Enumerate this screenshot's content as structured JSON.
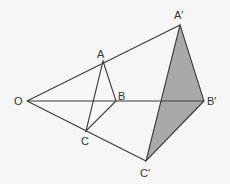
{
  "diagram": {
    "type": "enlargement-geometry",
    "colors": {
      "background": "#f6f6f6",
      "line": "#3a3a3a",
      "shade": "#a9a9a9"
    },
    "points": {
      "O": {
        "label": "O",
        "x": 27,
        "y": 101
      },
      "A": {
        "label": "A",
        "x": 103,
        "y": 61
      },
      "B": {
        "label": "B",
        "x": 116,
        "y": 101
      },
      "C": {
        "label": "C",
        "x": 86,
        "y": 131
      },
      "A_prime": {
        "label": "A′",
        "x": 180,
        "y": 25
      },
      "B_prime": {
        "label": "B′",
        "x": 204,
        "y": 101
      },
      "C_prime": {
        "label": "C′",
        "x": 146,
        "y": 161
      }
    }
  }
}
